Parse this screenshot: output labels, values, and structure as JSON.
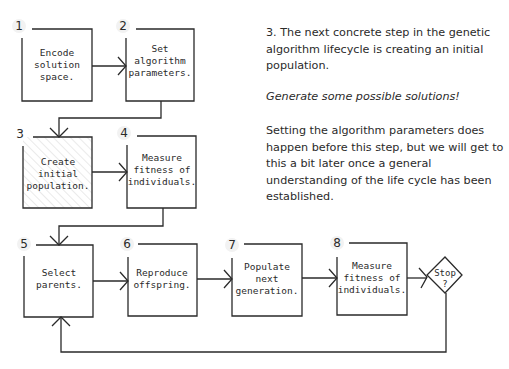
{
  "diagram": {
    "title": "Genetic algorithm lifecycle",
    "steps": [
      {
        "num": "1",
        "lines": [
          "Encode",
          "solution",
          "space."
        ],
        "highlighted": false
      },
      {
        "num": "2",
        "lines": [
          "Set",
          "algorithm",
          "parameters."
        ],
        "highlighted": false
      },
      {
        "num": "3",
        "lines": [
          "Create",
          "initial",
          "population."
        ],
        "highlighted": true
      },
      {
        "num": "4",
        "lines": [
          "Measure",
          "fitness of",
          "individuals."
        ],
        "highlighted": false
      },
      {
        "num": "5",
        "lines": [
          "Select",
          "parents."
        ],
        "highlighted": false
      },
      {
        "num": "6",
        "lines": [
          "Reproduce",
          "offspring."
        ],
        "highlighted": false
      },
      {
        "num": "7",
        "lines": [
          "Populate",
          "next",
          "generation."
        ],
        "highlighted": false
      },
      {
        "num": "8",
        "lines": [
          "Measure",
          "fitness of",
          "individuals."
        ],
        "highlighted": false
      }
    ],
    "decision": {
      "lines": [
        "Stop",
        "?"
      ]
    }
  },
  "description": {
    "paragraph1": "3. The next concrete step in the genetic algorithm lifecycle is creating an initial population.",
    "emphasis": "Generate some possible solutions!",
    "paragraph2": "Setting the algorithm parameters does happen before this step, but we will get to this a bit later once a general understanding of the life cycle has been established."
  },
  "colors": {
    "ink": "#2a2a2a",
    "hatch": "#d6d6d6",
    "number_bg": "#f2f2f2"
  }
}
